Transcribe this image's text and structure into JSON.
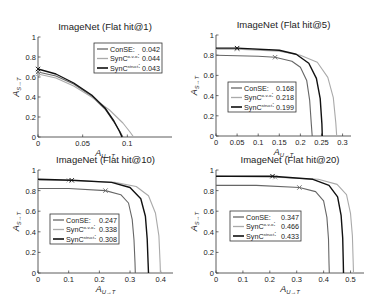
{
  "chart_data": [
    {
      "type": "line",
      "title": "ImageNet (Flat hit@1)",
      "xlabel": "A_{U→T}",
      "ylabel": "A_{S→T}",
      "xlim": [
        0,
        0.15
      ],
      "ylim": [
        0,
        1
      ],
      "xticks": [
        0,
        0.05,
        0.1
      ],
      "xtick_labels": [
        "0",
        "0.05",
        "0.1"
      ],
      "yticks": [
        0,
        0.2,
        0.4,
        0.6,
        0.8,
        1
      ],
      "ytick_labels": [
        "0",
        "0.2",
        "0.4",
        "0.6",
        "0.8",
        "1"
      ],
      "legend_position": "upper right",
      "frame": {
        "x": 38,
        "y": 37,
        "w": 134,
        "h": 100
      },
      "legend": {
        "x": 94,
        "y": 43,
        "w": 68,
        "h": 30
      },
      "series": [
        {
          "name": "ConSE",
          "auc": "0.042",
          "color": "#666666",
          "width": 1.1,
          "x": [
            0,
            0.02,
            0.04,
            0.06,
            0.075,
            0.085,
            0.092,
            0.095
          ],
          "y": [
            0.65,
            0.61,
            0.53,
            0.41,
            0.28,
            0.15,
            0.05,
            0
          ],
          "marker_at": [
            0,
            0.65
          ]
        },
        {
          "name": "SynC^{o-v-o}",
          "auc": "0.044",
          "color": "#aaaaaa",
          "width": 1.1,
          "x": [
            0,
            0.02,
            0.04,
            0.06,
            0.08,
            0.095,
            0.103,
            0.107
          ],
          "y": [
            0.63,
            0.59,
            0.51,
            0.4,
            0.27,
            0.14,
            0.05,
            0
          ],
          "marker_at": [
            0,
            0.63
          ]
        },
        {
          "name": "SynC^{struct}",
          "auc": "0.043",
          "color": "#111111",
          "width": 1.4,
          "x": [
            0,
            0.02,
            0.04,
            0.06,
            0.075,
            0.085,
            0.091,
            0.094
          ],
          "y": [
            0.68,
            0.63,
            0.54,
            0.42,
            0.29,
            0.16,
            0.06,
            0
          ],
          "marker_at": [
            0,
            0.68
          ]
        }
      ]
    },
    {
      "type": "line",
      "title": "ImageNet (Flat hit@5)",
      "xlabel": "A_{U→T}",
      "ylabel": "A_{S→T}",
      "xlim": [
        0,
        0.32
      ],
      "ylim": [
        0,
        1
      ],
      "xticks": [
        0,
        0.05,
        0.1,
        0.15,
        0.2,
        0.25,
        0.3
      ],
      "xtick_labels": [
        "0",
        "0.05",
        "0.1",
        "0.15",
        "0.2",
        "0.25",
        "0.3"
      ],
      "yticks": [
        0,
        0.2,
        0.4,
        0.6,
        0.8,
        1
      ],
      "ytick_labels": [
        "0",
        "0.2",
        "0.4",
        "0.6",
        "0.8",
        "1"
      ],
      "legend_position": "lower left",
      "frame": {
        "x": 216,
        "y": 35,
        "w": 135,
        "h": 101
      },
      "legend": {
        "x": 228,
        "y": 82,
        "w": 68,
        "h": 30
      },
      "series": [
        {
          "name": "ConSE",
          "auc": "0.168",
          "color": "#666666",
          "width": 1.1,
          "x": [
            0,
            0.1,
            0.14,
            0.18,
            0.2,
            0.215,
            0.222,
            0.226,
            0.228
          ],
          "y": [
            0.8,
            0.79,
            0.78,
            0.74,
            0.68,
            0.55,
            0.35,
            0.12,
            0
          ],
          "marker_at": [
            0.14,
            0.78
          ]
        },
        {
          "name": "SynC^{o-v-o}",
          "auc": "0.218",
          "color": "#aaaaaa",
          "width": 1.1,
          "x": [
            0,
            0.05,
            0.15,
            0.2,
            0.24,
            0.265,
            0.278,
            0.284,
            0.286
          ],
          "y": [
            0.86,
            0.86,
            0.84,
            0.8,
            0.73,
            0.58,
            0.38,
            0.13,
            0
          ],
          "marker_at": [
            0.05,
            0.86
          ]
        },
        {
          "name": "SynC^{struct}",
          "auc": "0.199",
          "color": "#111111",
          "width": 1.4,
          "x": [
            0,
            0.05,
            0.15,
            0.19,
            0.22,
            0.238,
            0.247,
            0.251,
            0.252
          ],
          "y": [
            0.87,
            0.87,
            0.85,
            0.81,
            0.72,
            0.57,
            0.37,
            0.12,
            0
          ],
          "marker_at": [
            0.05,
            0.87
          ]
        }
      ]
    },
    {
      "type": "line",
      "title": "ImageNet (Flat hit@10)",
      "xlabel": "A_{U→T}",
      "ylabel": "A_{S→T}",
      "xlim": [
        0,
        0.44
      ],
      "ylim": [
        0,
        1
      ],
      "xticks": [
        0,
        0.1,
        0.2,
        0.3,
        0.4
      ],
      "xtick_labels": [
        "0",
        "0.1",
        "0.2",
        "0.3",
        "0.4"
      ],
      "yticks": [
        0,
        0.2,
        0.4,
        0.6,
        0.8,
        1
      ],
      "ytick_labels": [
        "0",
        "0.2",
        "0.4",
        "0.6",
        "0.8",
        "1"
      ],
      "legend_position": "lower left",
      "frame": {
        "x": 38,
        "y": 170,
        "w": 135,
        "h": 103
      },
      "legend": {
        "x": 50,
        "y": 214,
        "w": 69,
        "h": 30
      },
      "series": [
        {
          "name": "ConSE",
          "auc": "0.247",
          "color": "#666666",
          "width": 1.1,
          "x": [
            0,
            0.1,
            0.22,
            0.27,
            0.295,
            0.307,
            0.313,
            0.316,
            0.317
          ],
          "y": [
            0.82,
            0.82,
            0.8,
            0.76,
            0.68,
            0.52,
            0.32,
            0.1,
            0
          ],
          "marker_at": [
            0.22,
            0.8
          ]
        },
        {
          "name": "SynC^{o-v-o}",
          "auc": "0.338",
          "color": "#aaaaaa",
          "width": 1.1,
          "x": [
            0,
            0.1,
            0.25,
            0.32,
            0.36,
            0.383,
            0.394,
            0.398,
            0.399
          ],
          "y": [
            0.9,
            0.9,
            0.88,
            0.84,
            0.75,
            0.58,
            0.36,
            0.1,
            0
          ],
          "marker_at": [
            0.1,
            0.9
          ]
        },
        {
          "name": "SynC^{struct}",
          "auc": "0.308",
          "color": "#111111",
          "width": 1.4,
          "x": [
            0,
            0.11,
            0.24,
            0.3,
            0.335,
            0.35,
            0.356,
            0.359,
            0.36
          ],
          "y": [
            0.91,
            0.9,
            0.88,
            0.83,
            0.72,
            0.55,
            0.33,
            0.1,
            0
          ],
          "marker_at": [
            0.11,
            0.9
          ]
        }
      ]
    },
    {
      "type": "line",
      "title": "ImageNet (Flat hit@20)",
      "xlabel": "A_{U→T}",
      "ylabel": "A_{S→T}",
      "xlim": [
        0,
        0.55
      ],
      "ylim": [
        0,
        1
      ],
      "xticks": [
        0,
        0.1,
        0.2,
        0.3,
        0.4,
        0.5
      ],
      "xtick_labels": [
        "0",
        "0.1",
        "0.2",
        "0.3",
        "0.4",
        "0.5"
      ],
      "yticks": [
        0,
        0.2,
        0.4,
        0.6,
        0.8,
        1
      ],
      "ytick_labels": [
        "0",
        "0.2",
        "0.4",
        "0.6",
        "0.8",
        "1"
      ],
      "legend_position": "lower left",
      "frame": {
        "x": 216,
        "y": 170,
        "w": 148,
        "h": 103
      },
      "legend": {
        "x": 230,
        "y": 211,
        "w": 71,
        "h": 30
      },
      "series": [
        {
          "name": "ConSE",
          "auc": "0.347",
          "color": "#666666",
          "width": 1.1,
          "x": [
            0,
            0.15,
            0.31,
            0.37,
            0.4,
            0.412,
            0.418,
            0.42,
            0.421
          ],
          "y": [
            0.85,
            0.85,
            0.83,
            0.79,
            0.7,
            0.54,
            0.33,
            0.1,
            0
          ],
          "marker_at": [
            0.31,
            0.83
          ]
        },
        {
          "name": "SynC^{o-v-o}",
          "auc": "0.466",
          "color": "#aaaaaa",
          "width": 1.1,
          "x": [
            0,
            0.22,
            0.38,
            0.45,
            0.485,
            0.5,
            0.507,
            0.51,
            0.511
          ],
          "y": [
            0.94,
            0.93,
            0.91,
            0.86,
            0.76,
            0.58,
            0.36,
            0.1,
            0
          ],
          "marker_at": [
            0.22,
            0.93
          ]
        },
        {
          "name": "SynC^{struct}",
          "auc": "0.433",
          "color": "#111111",
          "width": 1.4,
          "x": [
            0,
            0.21,
            0.36,
            0.42,
            0.452,
            0.465,
            0.471,
            0.473,
            0.474
          ],
          "y": [
            0.94,
            0.94,
            0.91,
            0.85,
            0.74,
            0.56,
            0.34,
            0.1,
            0
          ],
          "marker_at": [
            0.21,
            0.94
          ]
        }
      ]
    }
  ]
}
